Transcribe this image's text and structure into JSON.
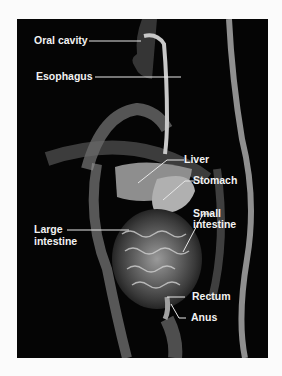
{
  "figure": {
    "labels": {
      "oral_cavity": "Oral cavity",
      "esophagus": "Esophagus",
      "liver": "Liver",
      "stomach": "Stomach",
      "small_intestine_1": "Small",
      "small_intestine_2": "intestine",
      "large_intestine_1": "Large",
      "large_intestine_2": "intestine",
      "rectum": "Rectum",
      "anus": "Anus"
    },
    "colors": {
      "background": "#050505",
      "label": "#f2f2f2",
      "margin": "#fbfbfb"
    }
  }
}
